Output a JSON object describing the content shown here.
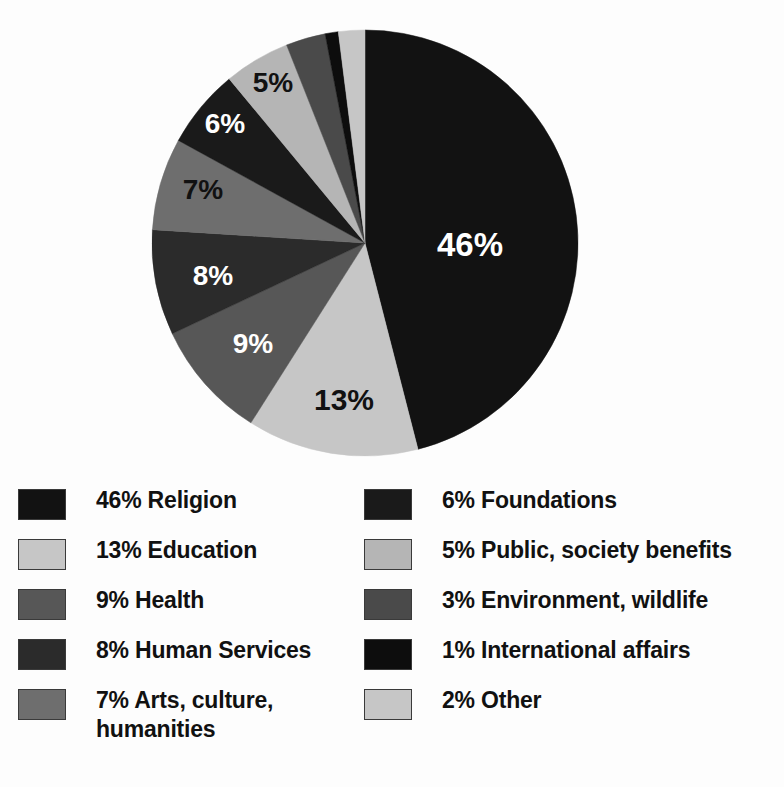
{
  "chart_data": {
    "type": "pie",
    "title": "",
    "subtitle": "",
    "xlabel": "",
    "ylabel": "",
    "legend_position": "bottom",
    "grid": false,
    "start_angle_deg": 0,
    "direction": "clockwise",
    "categories": [
      "Religion",
      "Education",
      "Health",
      "Human Services",
      "Arts, culture, humanities",
      "Foundations",
      "Public, society benefits",
      "Environment, wildlife",
      "International affairs",
      "Other"
    ],
    "values": [
      46,
      13,
      9,
      8,
      7,
      6,
      5,
      3,
      1,
      2
    ],
    "unit": "%",
    "colors": [
      "#121212",
      "#c6c6c6",
      "#575757",
      "#2b2b2b",
      "#6e6e6e",
      "#1a1a1a",
      "#b5b5b5",
      "#4a4a4a",
      "#0d0d0d",
      "#c6c6c6"
    ],
    "slices": [
      {
        "label": "46%",
        "value": 46,
        "category": "Religion",
        "color": "#121212",
        "label_color": "#ffffff",
        "label_visible": true,
        "label_x": 470,
        "label_y": 256,
        "label_size": 33
      },
      {
        "label": "13%",
        "value": 13,
        "category": "Education",
        "color": "#c6c6c6",
        "label_color": "#111111",
        "label_visible": true,
        "label_x": 344,
        "label_y": 410,
        "label_size": 30
      },
      {
        "label": "9%",
        "value": 9,
        "category": "Health",
        "color": "#575757",
        "label_color": "#ffffff",
        "label_visible": true,
        "label_x": 253,
        "label_y": 353,
        "label_size": 28
      },
      {
        "label": "8%",
        "value": 8,
        "category": "Human Services",
        "color": "#2b2b2b",
        "label_color": "#ffffff",
        "label_visible": true,
        "label_x": 213,
        "label_y": 285,
        "label_size": 28
      },
      {
        "label": "7%",
        "value": 7,
        "category": "Arts, culture, humanities",
        "color": "#6e6e6e",
        "label_color": "#111111",
        "label_visible": true,
        "label_x": 203,
        "label_y": 199,
        "label_size": 28
      },
      {
        "label": "6%",
        "value": 6,
        "category": "Foundations",
        "color": "#1a1a1a",
        "label_color": "#ffffff",
        "label_visible": true,
        "label_x": 225,
        "label_y": 133,
        "label_size": 28
      },
      {
        "label": "5%",
        "value": 5,
        "category": "Public, society benefits",
        "color": "#b5b5b5",
        "label_color": "#111111",
        "label_visible": true,
        "label_x": 273,
        "label_y": 92,
        "label_size": 28
      },
      {
        "label": "3%",
        "value": 3,
        "category": "Environment, wildlife",
        "color": "#4a4a4a",
        "label_color": "#111111",
        "label_visible": false,
        "label_x": 0,
        "label_y": 0,
        "label_size": 24
      },
      {
        "label": "1%",
        "value": 1,
        "category": "International affairs",
        "color": "#0d0d0d",
        "label_color": "#ffffff",
        "label_visible": false,
        "label_x": 0,
        "label_y": 0,
        "label_size": 24
      },
      {
        "label": "2%",
        "value": 2,
        "category": "Other",
        "color": "#c6c6c6",
        "label_color": "#111111",
        "label_visible": false,
        "label_x": 0,
        "label_y": 0,
        "label_size": 24
      }
    ],
    "geometry": {
      "cx": 365,
      "cy": 243,
      "r": 213
    }
  },
  "legend": {
    "columns": [
      {
        "items": [
          {
            "swatch": "#121212",
            "text": "46% Religion"
          },
          {
            "swatch": "#c6c6c6",
            "text": "13% Education"
          },
          {
            "swatch": "#575757",
            "text": "9% Health"
          },
          {
            "swatch": "#2b2b2b",
            "text": "8% Human Services"
          },
          {
            "swatch": "#6e6e6e",
            "text": "7% Arts, culture,\nhumanities"
          }
        ]
      },
      {
        "items": [
          {
            "swatch": "#1a1a1a",
            "text": "6% Foundations"
          },
          {
            "swatch": "#b5b5b5",
            "text": "5% Public, society benefits"
          },
          {
            "swatch": "#4a4a4a",
            "text": "3% Environment, wildlife"
          },
          {
            "swatch": "#0d0d0d",
            "text": "1% International affairs"
          },
          {
            "swatch": "#c6c6c6",
            "text": "2% Other"
          }
        ]
      }
    ]
  }
}
